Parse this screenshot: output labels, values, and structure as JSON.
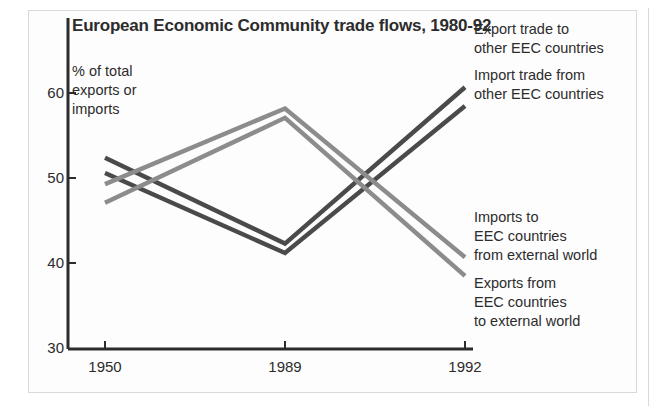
{
  "figure": {
    "title": "European Economic Community trade flows, 1980-92",
    "axis_note": "% of total\nexports or\nimports"
  },
  "axes": {
    "y_ticks": [
      "60",
      "50",
      "40",
      "30"
    ],
    "x_ticks": [
      "1950",
      "1989",
      "1992"
    ]
  },
  "series_labels": {
    "export_to_eec": "Export trade to\nother EEC countries",
    "import_from_eec": "Import trade from\nother EEC countries",
    "imports_external": "Imports to\nEEC countries\nfrom external world",
    "exports_external": "Exports from\nEEC countries\nto external world"
  },
  "colors": {
    "dark_line": "#4a4a4a",
    "mid_line": "#8c8c8c",
    "axis": "#2c2c2c",
    "text": "#2c2c2c",
    "frame": "#d9d9d9"
  },
  "chart_data": {
    "type": "line",
    "title": "European Economic Community trade flows, 1980-92",
    "xlabel": "",
    "ylabel": "% of total exports or imports",
    "x": [
      "1950",
      "1989",
      "1992"
    ],
    "ylim": [
      30,
      63
    ],
    "y_ticks": [
      30,
      40,
      50,
      60
    ],
    "grid": false,
    "legend": "right-inline-labels",
    "series": [
      {
        "name": "Export trade to other EEC countries",
        "color": "#4a4a4a",
        "values": [
          52.5,
          42.4,
          60.8
        ]
      },
      {
        "name": "Import trade from other EEC countries",
        "color": "#4a4a4a",
        "values": [
          50.7,
          41.3,
          58.6
        ]
      },
      {
        "name": "Imports to EEC countries from external world",
        "color": "#8c8c8c",
        "values": [
          49.4,
          58.3,
          40.8
        ]
      },
      {
        "name": "Exports from EEC countries to external world",
        "color": "#8c8c8c",
        "values": [
          47.2,
          57.2,
          38.6
        ]
      }
    ]
  }
}
